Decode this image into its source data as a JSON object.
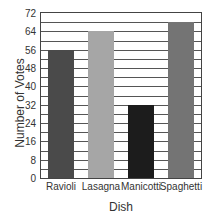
{
  "chart_data": {
    "type": "bar",
    "title": "",
    "xlabel": "Dish",
    "ylabel": "Number of Votes",
    "categories": [
      "Ravioli",
      "Lasagna",
      "Manicotti",
      "Spaghetti"
    ],
    "values": [
      56,
      64,
      32,
      68
    ],
    "colors": [
      "#4a4a4a",
      "#a6a6a6",
      "#1c1c1c",
      "#747474"
    ],
    "ylim": [
      0,
      72
    ],
    "yticks": [
      0,
      8,
      16,
      24,
      32,
      40,
      48,
      56,
      64,
      72
    ],
    "grid": true,
    "grid_step": 4,
    "legend": null
  }
}
